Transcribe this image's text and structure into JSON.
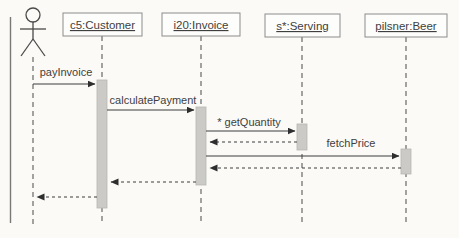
{
  "diagram": {
    "type": "uml-sequence-diagram",
    "actor": {
      "name": "actor"
    },
    "objects": [
      {
        "id": "customer",
        "label": "c5:Customer"
      },
      {
        "id": "invoice",
        "label": "i20:Invoice"
      },
      {
        "id": "serving",
        "label": "s*:Serving"
      },
      {
        "id": "beer",
        "label": "pilsner:Beer"
      }
    ],
    "messages": [
      {
        "label": "payInvoice",
        "from": "actor",
        "to": "c5:Customer",
        "kind": "synchronous"
      },
      {
        "label": "calculatePayment",
        "from": "c5:Customer",
        "to": "i20:Invoice",
        "kind": "synchronous"
      },
      {
        "label": "* getQuantity",
        "from": "i20:Invoice",
        "to": "s*:Serving",
        "kind": "synchronous"
      },
      {
        "label": "fetchPrice",
        "from": "i20:Invoice",
        "to": "pilsner:Beer",
        "kind": "synchronous"
      },
      {
        "label": "",
        "from": "s*:Serving",
        "to": "i20:Invoice",
        "kind": "return"
      },
      {
        "label": "",
        "from": "pilsner:Beer",
        "to": "i20:Invoice",
        "kind": "return"
      },
      {
        "label": "",
        "from": "i20:Invoice",
        "to": "c5:Customer",
        "kind": "return"
      },
      {
        "label": "",
        "from": "c5:Customer",
        "to": "actor",
        "kind": "return"
      }
    ],
    "colors": {
      "background": "#fbfaf7",
      "line": "#3d3d3d",
      "box_border": "#8b8b8b",
      "box_fill": "#fdfdfb",
      "activation_fill": "#cbcac7",
      "text": "#3f3f3f"
    }
  }
}
